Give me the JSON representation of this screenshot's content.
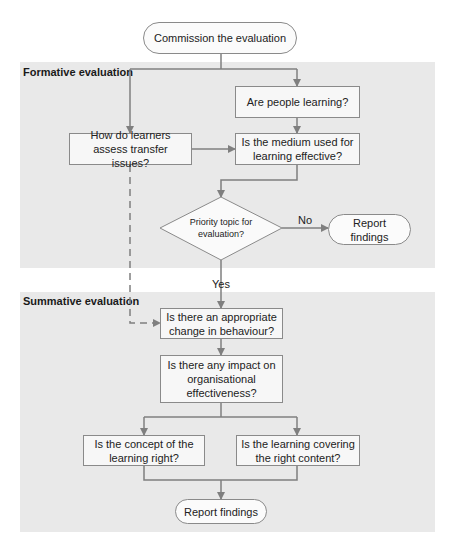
{
  "diagram": {
    "start": "Commission the evaluation",
    "regions": {
      "formative": "Formative evaluation",
      "summative": "Summative evaluation"
    },
    "nodes": {
      "people_learning": "Are people learning?",
      "transfer": "How do learners assess transfer issues?",
      "medium": "Is the medium used for learning effective?",
      "priority": "Priority topic for evaluation?",
      "report_1": "Report findings",
      "behaviour": "Is there an appropriate change in behaviour?",
      "impact": "Is there any impact on organisational effectiveness?",
      "concept": "Is the concept of the learning right?",
      "content": "Is the learning covering the right content?",
      "report_2": "Report findings"
    },
    "edge_labels": {
      "no": "No",
      "yes": "Yes"
    },
    "colors": {
      "region_fill": "#e9e9e9",
      "box_fill": "#f7f7f7",
      "line": "#7f7f7f"
    }
  }
}
